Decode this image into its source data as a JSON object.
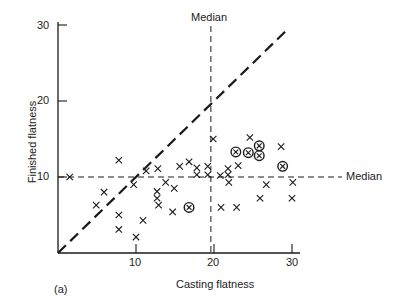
{
  "chart_data": {
    "type": "scatter",
    "title": "",
    "panel_label": "(a)",
    "xlabel": "Casting flatness",
    "ylabel": "Finished flatness",
    "xlim": [
      0,
      31
    ],
    "ylim": [
      0,
      31
    ],
    "xticks": [
      10,
      20,
      30
    ],
    "yticks": [
      10,
      20,
      30
    ],
    "grid": false,
    "reference_lines": [
      {
        "name": "equality-line",
        "type": "diagonal",
        "from": [
          0,
          0
        ],
        "to": [
          29.5,
          29.5
        ],
        "style": "long-dash"
      },
      {
        "name": "median-vertical",
        "label": "Median",
        "type": "vertical",
        "x": 19.6,
        "style": "dashed"
      },
      {
        "name": "median-horizontal",
        "label": "Median",
        "type": "horizontal",
        "y": 10,
        "style": "dashed"
      }
    ],
    "series": [
      {
        "name": "cross",
        "marker": "x",
        "points": [
          [
            1.5,
            10
          ],
          [
            5.9,
            8
          ],
          [
            4.9,
            6.3
          ],
          [
            7.8,
            12.2
          ],
          [
            7.8,
            5
          ],
          [
            7.8,
            3.1
          ],
          [
            9.7,
            9
          ],
          [
            10,
            2.1
          ],
          [
            10.9,
            4.3
          ],
          [
            11.3,
            10.8
          ],
          [
            12.8,
            11.1
          ],
          [
            12.7,
            8.1
          ],
          [
            12.7,
            7.2
          ],
          [
            12.9,
            6.3
          ],
          [
            13.8,
            9.3
          ],
          [
            14.9,
            8.5
          ],
          [
            14.7,
            5.4
          ],
          [
            15.6,
            11.4
          ],
          [
            16.8,
            12
          ],
          [
            17.8,
            11.2
          ],
          [
            17.8,
            10.3
          ],
          [
            19.2,
            11.4
          ],
          [
            19.2,
            10.3
          ],
          [
            19.9,
            15
          ],
          [
            20.8,
            10.2
          ],
          [
            20.9,
            6
          ],
          [
            21.8,
            11.1
          ],
          [
            21.8,
            10.3
          ],
          [
            21.9,
            9.3
          ],
          [
            22.9,
            6
          ],
          [
            23.1,
            11.5
          ],
          [
            24.6,
            15.2
          ],
          [
            26.7,
            9
          ],
          [
            25.9,
            7.2
          ],
          [
            28.6,
            14
          ],
          [
            30.1,
            9.3
          ],
          [
            30,
            7.2
          ]
        ]
      },
      {
        "name": "circled-cross",
        "marker": "circled-x",
        "points": [
          [
            16.8,
            6
          ],
          [
            22.8,
            13.3
          ],
          [
            24.4,
            13.2
          ],
          [
            25.8,
            14.1
          ],
          [
            25.8,
            12.8
          ],
          [
            28.8,
            11.4
          ]
        ]
      }
    ]
  },
  "labels": {
    "median_top": "Median",
    "median_right": "Median",
    "xlabel": "Casting flatness",
    "ylabel": "Finished flatness",
    "panel": "(a)",
    "xtick_10": "10",
    "xtick_20": "20",
    "xtick_30": "30",
    "ytick_10": "10",
    "ytick_20": "20",
    "ytick_30": "30"
  }
}
